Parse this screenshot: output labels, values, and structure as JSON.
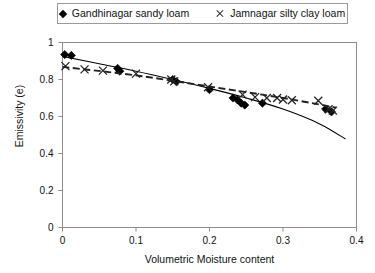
{
  "legend": {
    "entries": [
      {
        "label": "Gandhinagar sandy loam",
        "marker": "diamond-marker-icon"
      },
      {
        "label": "Jamnagar silty clay loam",
        "marker": "cross-marker-icon"
      }
    ]
  },
  "axes": {
    "x_title": "Volumetric Moisture content",
    "y_title": "Emissivity (e)",
    "x_ticks": [
      "0",
      "0.1",
      "0.2",
      "0.3",
      "0.4"
    ],
    "y_ticks": [
      "0",
      "0.2",
      "0.4",
      "0.6",
      "0.8",
      "1"
    ]
  },
  "chart_data": {
    "type": "scatter",
    "title": "",
    "xlabel": "Volumetric Moisture content",
    "ylabel": "Emissivity (e)",
    "xlim": [
      0,
      0.4
    ],
    "ylim": [
      0,
      1
    ],
    "xticks": [
      0,
      0.1,
      0.2,
      0.3,
      0.4
    ],
    "yticks": [
      0,
      0.2,
      0.4,
      0.6,
      0.8,
      1
    ],
    "grid": false,
    "legend_position": "top-center",
    "series": [
      {
        "name": "Gandhinagar sandy loam",
        "marker": "diamond",
        "color": "#000000",
        "points": [
          [
            0.003,
            0.935
          ],
          [
            0.012,
            0.93
          ],
          [
            0.075,
            0.86
          ],
          [
            0.078,
            0.845
          ],
          [
            0.15,
            0.8
          ],
          [
            0.155,
            0.788
          ],
          [
            0.2,
            0.745
          ],
          [
            0.232,
            0.7
          ],
          [
            0.238,
            0.69
          ],
          [
            0.243,
            0.672
          ],
          [
            0.248,
            0.662
          ],
          [
            0.272,
            0.672
          ],
          [
            0.358,
            0.64
          ],
          [
            0.366,
            0.625
          ]
        ],
        "trend": {
          "style": "solid",
          "curve": [
            [
              0.0,
              0.925
            ],
            [
              0.05,
              0.885
            ],
            [
              0.1,
              0.845
            ],
            [
              0.15,
              0.8
            ],
            [
              0.2,
              0.752
            ],
            [
              0.25,
              0.7
            ],
            [
              0.3,
              0.64
            ],
            [
              0.35,
              0.56
            ],
            [
              0.385,
              0.478
            ]
          ]
        }
      },
      {
        "name": "Jamnagar silty clay loam",
        "marker": "cross",
        "color": "#222222",
        "points": [
          [
            0.004,
            0.872
          ],
          [
            0.03,
            0.855
          ],
          [
            0.055,
            0.848
          ],
          [
            0.1,
            0.832
          ],
          [
            0.148,
            0.8
          ],
          [
            0.152,
            0.79
          ],
          [
            0.198,
            0.758
          ],
          [
            0.245,
            0.718
          ],
          [
            0.262,
            0.705
          ],
          [
            0.278,
            0.7
          ],
          [
            0.292,
            0.7
          ],
          [
            0.3,
            0.692
          ],
          [
            0.312,
            0.688
          ],
          [
            0.348,
            0.685
          ],
          [
            0.362,
            0.64
          ],
          [
            0.368,
            0.632
          ]
        ],
        "trend": {
          "style": "dashed",
          "curve": [
            [
              0.0,
              0.868
            ],
            [
              0.1,
              0.822
            ],
            [
              0.2,
              0.762
            ],
            [
              0.3,
              0.7
            ],
            [
              0.372,
              0.648
            ]
          ]
        }
      }
    ]
  },
  "footer": {
    "clipped_caption": ""
  }
}
